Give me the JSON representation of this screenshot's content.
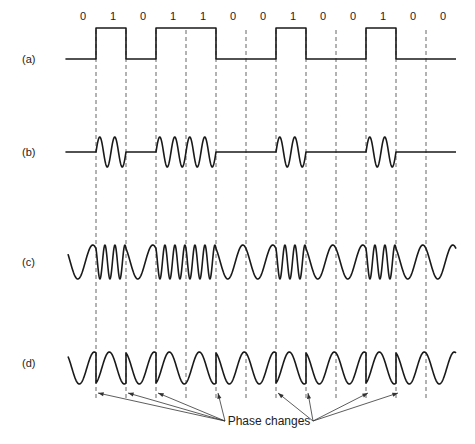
{
  "figure": {
    "bits": [
      "0",
      "1",
      "0",
      "1",
      "1",
      "0",
      "0",
      "1",
      "0",
      "0",
      "1",
      "0",
      "0"
    ],
    "rows": [
      {
        "id": "a",
        "label": "(a)",
        "kind": "binary signal"
      },
      {
        "id": "b",
        "label": "(b)",
        "kind": "amplitude modulation"
      },
      {
        "id": "c",
        "label": "(c)",
        "kind": "frequency modulation"
      },
      {
        "id": "d",
        "label": "(d)",
        "kind": "phase modulation"
      }
    ],
    "annotation": "Phase changes",
    "phase_change_positions_bit_index": [
      1,
      2,
      3,
      5,
      7,
      8,
      10,
      11
    ],
    "colors": {
      "line": "#1a1a1a",
      "dash": "#555555",
      "text": "#222222",
      "background": "#ffffff"
    }
  }
}
